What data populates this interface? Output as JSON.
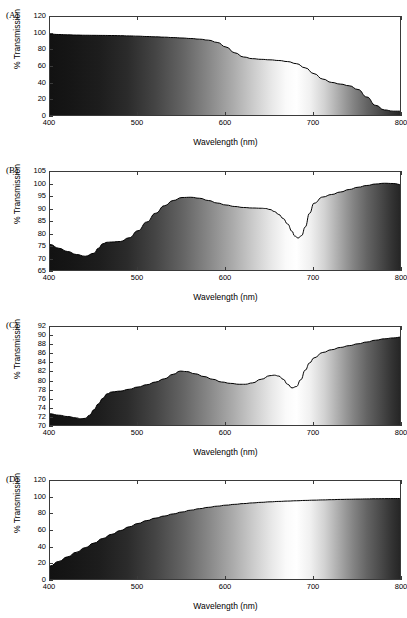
{
  "figure": {
    "background": "#ffffff",
    "axis_color": "#3a3a3a",
    "curve_color": "#000000",
    "gradient_light_hex": "#ffffff",
    "gradient_dark_hex": "#111111"
  },
  "common": {
    "xlabel": "Wavelength (nm)",
    "ylabel": "% Transmission",
    "xticks": [
      400,
      500,
      600,
      700,
      800
    ],
    "xlim": [
      400,
      800
    ]
  },
  "panels": [
    {
      "label": "(A)",
      "yticks": [
        0,
        20,
        40,
        60,
        80,
        100,
        120
      ],
      "ylim": [
        0,
        120
      ]
    },
    {
      "label": "(B)",
      "yticks": [
        65,
        70,
        75,
        80,
        85,
        90,
        95,
        100,
        105
      ],
      "ylim": [
        65,
        105
      ]
    },
    {
      "label": "(C)",
      "yticks": [
        70,
        72,
        74,
        76,
        78,
        80,
        82,
        84,
        86,
        88,
        90,
        92
      ],
      "ylim": [
        70,
        92
      ]
    },
    {
      "label": "(D)",
      "yticks": [
        0,
        20,
        40,
        60,
        80,
        100,
        120
      ],
      "ylim": [
        0,
        120
      ]
    }
  ],
  "chart_data": [
    {
      "type": "area",
      "panel": "(A)",
      "title": "",
      "xlabel": "Wavelength (nm)",
      "ylabel": "% Transmission",
      "xlim": [
        400,
        800
      ],
      "ylim": [
        0,
        120
      ],
      "xticks": [
        400,
        500,
        600,
        700,
        800
      ],
      "yticks": [
        0,
        20,
        40,
        60,
        80,
        100,
        120
      ],
      "grid": false,
      "legend": "none",
      "x": [
        400,
        410,
        420,
        430,
        440,
        450,
        460,
        470,
        480,
        490,
        500,
        510,
        520,
        530,
        540,
        550,
        560,
        570,
        580,
        590,
        600,
        610,
        620,
        630,
        640,
        650,
        660,
        670,
        680,
        690,
        700,
        710,
        720,
        730,
        740,
        750,
        760,
        770,
        780,
        790,
        800
      ],
      "y": [
        99.5,
        99.0,
        98.6,
        98.3,
        98.1,
        98.0,
        97.9,
        97.8,
        97.6,
        97.3,
        97.0,
        96.6,
        96.2,
        95.8,
        95.3,
        94.8,
        94.2,
        93.4,
        92.2,
        89.5,
        84.0,
        77.0,
        72.0,
        70.0,
        69.2,
        68.6,
        67.8,
        66.5,
        64.0,
        59.0,
        52.0,
        45.5,
        41.5,
        39.5,
        37.5,
        33.0,
        24.0,
        14.0,
        8.5,
        7.0,
        7.0
      ],
      "series_name": "Transmission A"
    },
    {
      "type": "area",
      "panel": "(B)",
      "title": "",
      "xlabel": "Wavelength (nm)",
      "ylabel": "% Transmission",
      "xlim": [
        400,
        800
      ],
      "ylim": [
        65,
        105
      ],
      "xticks": [
        400,
        500,
        600,
        700,
        800
      ],
      "yticks": [
        65,
        70,
        75,
        80,
        85,
        90,
        95,
        100,
        105
      ],
      "grid": false,
      "legend": "none",
      "x": [
        400,
        410,
        420,
        430,
        440,
        450,
        455,
        460,
        465,
        470,
        480,
        490,
        500,
        510,
        520,
        530,
        540,
        550,
        560,
        570,
        580,
        590,
        600,
        610,
        620,
        630,
        640,
        645,
        650,
        655,
        660,
        665,
        670,
        675,
        678,
        682,
        686,
        690,
        695,
        700,
        710,
        720,
        730,
        740,
        750,
        760,
        770,
        780,
        790,
        800
      ],
      "y": [
        76.0,
        74.5,
        73.2,
        72.0,
        71.3,
        72.5,
        74.5,
        76.3,
        76.9,
        77.0,
        77.2,
        78.7,
        81.5,
        85.0,
        88.5,
        91.5,
        93.6,
        94.8,
        94.9,
        94.5,
        93.6,
        92.6,
        91.8,
        91.2,
        90.8,
        90.6,
        90.5,
        90.4,
        90.0,
        89.2,
        88.0,
        86.4,
        84.2,
        81.3,
        79.4,
        78.6,
        79.6,
        83.0,
        88.5,
        92.5,
        95.0,
        96.0,
        97.0,
        98.0,
        98.9,
        99.6,
        100.2,
        100.5,
        100.4,
        99.9
      ],
      "series_name": "Transmission B"
    },
    {
      "type": "area",
      "panel": "(C)",
      "title": "",
      "xlabel": "Wavelength (nm)",
      "ylabel": "% Transmission",
      "xlim": [
        400,
        800
      ],
      "ylim": [
        70,
        92
      ],
      "xticks": [
        400,
        500,
        600,
        700,
        800
      ],
      "yticks": [
        70,
        72,
        74,
        76,
        78,
        80,
        82,
        84,
        86,
        88,
        90,
        92
      ],
      "grid": false,
      "legend": "none",
      "x": [
        400,
        410,
        420,
        430,
        435,
        440,
        445,
        450,
        455,
        460,
        465,
        470,
        480,
        490,
        500,
        510,
        520,
        530,
        540,
        548,
        555,
        565,
        575,
        585,
        595,
        605,
        615,
        622,
        630,
        640,
        650,
        655,
        660,
        665,
        670,
        675,
        680,
        685,
        690,
        695,
        700,
        710,
        720,
        730,
        740,
        750,
        760,
        770,
        780,
        790,
        800
      ],
      "y": [
        72.9,
        72.6,
        72.3,
        72.0,
        71.8,
        71.9,
        72.6,
        73.8,
        75.1,
        76.3,
        77.3,
        77.7,
        77.9,
        78.3,
        78.8,
        79.3,
        79.9,
        80.6,
        81.6,
        82.3,
        82.2,
        81.7,
        81.1,
        80.5,
        79.9,
        79.6,
        79.4,
        79.4,
        79.7,
        80.5,
        81.3,
        81.4,
        81.2,
        80.5,
        79.4,
        78.6,
        78.9,
        80.4,
        82.5,
        84.1,
        85.2,
        86.4,
        87.0,
        87.5,
        87.9,
        88.3,
        88.7,
        89.1,
        89.4,
        89.6,
        89.8
      ],
      "series_name": "Transmission C"
    },
    {
      "type": "area",
      "panel": "(D)",
      "title": "",
      "xlabel": "Wavelength (nm)",
      "ylabel": "% Transmission",
      "xlim": [
        400,
        800
      ],
      "ylim": [
        0,
        120
      ],
      "xticks": [
        400,
        500,
        600,
        700,
        800
      ],
      "yticks": [
        0,
        20,
        40,
        60,
        80,
        100,
        120
      ],
      "grid": false,
      "legend": "none",
      "x": [
        400,
        410,
        420,
        430,
        440,
        450,
        460,
        470,
        480,
        490,
        500,
        510,
        520,
        530,
        540,
        550,
        560,
        570,
        580,
        590,
        600,
        610,
        620,
        630,
        640,
        650,
        660,
        670,
        680,
        690,
        700,
        710,
        720,
        730,
        740,
        750,
        760,
        770,
        780,
        790,
        800
      ],
      "y": [
        18.0,
        23.5,
        29.0,
        34.5,
        40.0,
        45.5,
        51.0,
        56.0,
        60.5,
        65.0,
        69.0,
        72.5,
        75.5,
        78.0,
        80.5,
        82.8,
        85.0,
        86.8,
        88.4,
        89.8,
        91.0,
        92.0,
        92.9,
        93.7,
        94.4,
        95.0,
        95.5,
        95.9,
        96.3,
        96.7,
        97.0,
        97.3,
        97.6,
        97.9,
        98.1,
        98.3,
        98.5,
        98.7,
        98.8,
        98.9,
        99.0
      ],
      "series_name": "Transmission D"
    }
  ]
}
